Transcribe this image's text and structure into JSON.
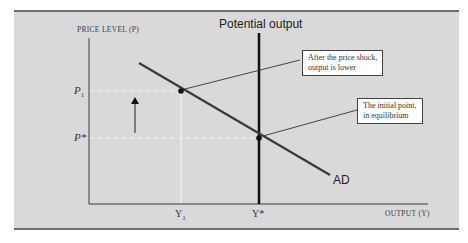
{
  "diagram": {
    "title": "Potential output",
    "y_axis_label": "PRICE LEVEL (P)",
    "x_axis_label": "OUTPUT (Y)",
    "curve_label": "AD",
    "y_ticks": {
      "p1": "P",
      "p1_sub": "1",
      "pstar": "P*"
    },
    "x_ticks": {
      "y1": "Y",
      "y1_sub": "1",
      "ystar": "Y*"
    },
    "callouts": [
      {
        "id": "price-shock",
        "lines": [
          "After the price shock,",
          "output is lower"
        ]
      },
      {
        "id": "initial-point",
        "lines": [
          "The initial point,",
          "in equilibrium"
        ]
      }
    ],
    "colors": {
      "background": "#d9d9d9",
      "curve": "#3a3a3a",
      "guide": "#f4f4f4",
      "axis": "#3a3a3a",
      "potential_line": "#111111"
    },
    "points": [
      {
        "name": "shock-point",
        "x": 181,
        "y": 91
      },
      {
        "name": "initial-point",
        "x": 259,
        "y": 138
      }
    ],
    "ad_line": {
      "x1": 139,
      "y1": 63,
      "x2": 330,
      "y2": 175
    }
  }
}
